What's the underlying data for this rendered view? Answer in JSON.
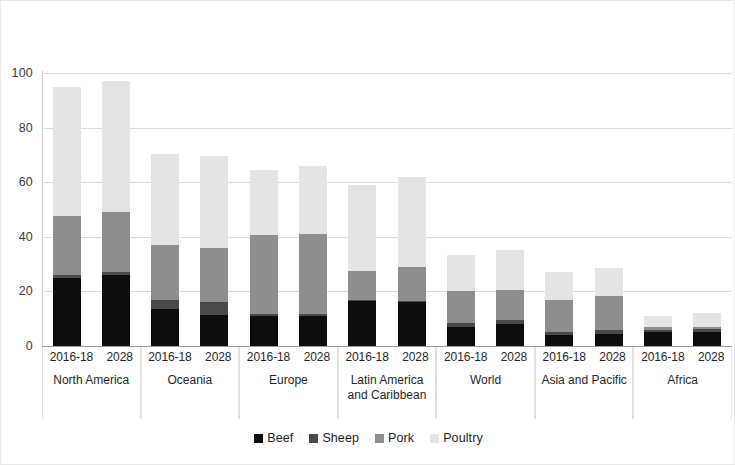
{
  "chart_data": {
    "type": "bar",
    "stacked": true,
    "title": "",
    "subtitle": "",
    "xlabel": "",
    "ylabel": "",
    "ylim": [
      0,
      100
    ],
    "yticks": [
      0,
      20,
      40,
      60,
      80,
      100
    ],
    "grid": true,
    "legend_position": "bottom",
    "legend": [
      "Beef",
      "Sheep",
      "Pork",
      "Poultry"
    ],
    "series_colors": {
      "Beef": "#0d0d0d",
      "Sheep": "#494949",
      "Pork": "#8e8e8e",
      "Poultry": "#e4e4e4"
    },
    "periods": [
      "2016-18",
      "2028"
    ],
    "categories": [
      "North America",
      "Oceania",
      "Europe",
      "Latin America and Caribbean",
      "World",
      "Asia and Pacific",
      "Africa"
    ],
    "groups": [
      {
        "category": "North America",
        "category_lines": [
          "North America"
        ],
        "bars": [
          {
            "period": "2016-18",
            "Beef": 25.0,
            "Sheep": 1.0,
            "Pork": 21.5,
            "Poultry": 47.5,
            "total": 95.0
          },
          {
            "period": "2028",
            "Beef": 26.0,
            "Sheep": 1.0,
            "Pork": 22.0,
            "Poultry": 48.0,
            "total": 97.0
          }
        ]
      },
      {
        "category": "Oceania",
        "category_lines": [
          "Oceania"
        ],
        "bars": [
          {
            "period": "2016-18",
            "Beef": 13.5,
            "Sheep": 3.5,
            "Pork": 20.0,
            "Poultry": 33.5,
            "total": 70.5
          },
          {
            "period": "2028",
            "Beef": 11.5,
            "Sheep": 4.5,
            "Pork": 20.0,
            "Poultry": 33.5,
            "total": 69.5
          }
        ]
      },
      {
        "category": "Europe",
        "category_lines": [
          "Europe"
        ],
        "bars": [
          {
            "period": "2016-18",
            "Beef": 11.0,
            "Sheep": 0.8,
            "Pork": 28.7,
            "Poultry": 24.0,
            "total": 64.5
          },
          {
            "period": "2028",
            "Beef": 11.0,
            "Sheep": 0.8,
            "Pork": 29.2,
            "Poultry": 25.0,
            "total": 66.0
          }
        ]
      },
      {
        "category": "Latin America and Caribbean",
        "category_lines": [
          "Latin America",
          "and Caribbean"
        ],
        "bars": [
          {
            "period": "2016-18",
            "Beef": 16.5,
            "Sheep": 0.5,
            "Pork": 10.5,
            "Poultry": 31.5,
            "total": 59.0
          },
          {
            "period": "2028",
            "Beef": 16.0,
            "Sheep": 0.5,
            "Pork": 12.5,
            "Poultry": 33.0,
            "total": 62.0
          }
        ]
      },
      {
        "category": "World",
        "category_lines": [
          "World"
        ],
        "bars": [
          {
            "period": "2016-18",
            "Beef": 7.0,
            "Sheep": 1.5,
            "Pork": 11.5,
            "Poultry": 13.5,
            "total": 33.5
          },
          {
            "period": "2028",
            "Beef": 8.0,
            "Sheep": 1.5,
            "Pork": 11.0,
            "Poultry": 14.5,
            "total": 35.0
          }
        ]
      },
      {
        "category": "Asia and Pacific",
        "category_lines": [
          "Asia and Pacific"
        ],
        "bars": [
          {
            "period": "2016-18",
            "Beef": 4.0,
            "Sheep": 1.2,
            "Pork": 11.8,
            "Poultry": 10.0,
            "total": 27.0
          },
          {
            "period": "2028",
            "Beef": 4.5,
            "Sheep": 1.2,
            "Pork": 12.8,
            "Poultry": 10.0,
            "total": 28.5
          }
        ]
      },
      {
        "category": "Africa",
        "category_lines": [
          "Africa"
        ],
        "bars": [
          {
            "period": "2016-18",
            "Beef": 5.0,
            "Sheep": 1.0,
            "Pork": 0.8,
            "Poultry": 4.2,
            "total": 11.0
          },
          {
            "period": "2028",
            "Beef": 5.0,
            "Sheep": 1.2,
            "Pork": 0.8,
            "Poultry": 5.0,
            "total": 12.0
          }
        ]
      }
    ]
  }
}
